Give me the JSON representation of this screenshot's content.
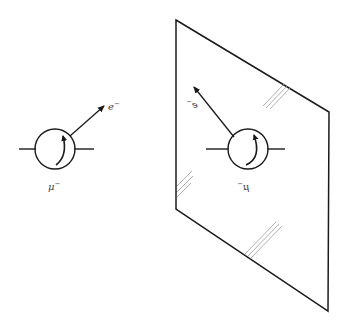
{
  "diagram": {
    "colors": {
      "stroke": "#1a1a1a",
      "glare": "#9a9a9a",
      "label": "#444444",
      "background": "#ffffff"
    },
    "original": {
      "particle_label": "μ",
      "particle_charge": "−",
      "emitted_label": "e",
      "emitted_charge": "−",
      "circle": {
        "cx": 55,
        "cy": 149,
        "r": 20
      },
      "spin_direction": "clockwise-arrow",
      "emission_arrow": {
        "from": [
          70,
          136
        ],
        "to": [
          105,
          105
        ]
      }
    },
    "mirror": {
      "particle_label": "μ",
      "particle_charge": "−",
      "emitted_label": "e",
      "emitted_charge": "−",
      "circle": {
        "cx": 248,
        "cy": 149,
        "r": 20
      },
      "emission_arrow": {
        "from": [
          234,
          137
        ],
        "to": [
          193,
          86
        ]
      },
      "plane_corners": [
        [
          176,
          20
        ],
        [
          329,
          112
        ],
        [
          328,
          311
        ],
        [
          176,
          209
        ]
      ]
    }
  }
}
